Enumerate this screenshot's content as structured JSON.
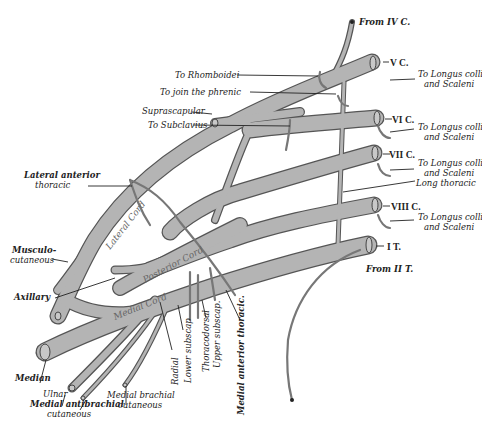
{
  "figure": {
    "roots": [
      {
        "label": "V C.",
        "branch": "To Longus colli and Scaleni"
      },
      {
        "label": "VI C.",
        "branch": "To Longus colli and Scaleni"
      },
      {
        "label": "VII C.",
        "branch": "To Longus colli and Scaleni"
      },
      {
        "label": "VIII C.",
        "branch": "To Longus colli and Scaleni"
      },
      {
        "label": "I T."
      }
    ],
    "top_labels": {
      "from_iv": "From IV C.",
      "from_ii": "From II T.",
      "rhomboidei": "To Rhomboidei",
      "phrenic": "To join the phrenic",
      "suprascapular": "Suprascapular",
      "subclavius": "To Subclavius",
      "longus_line1": "To Longus colli",
      "longus_line2": "and Scaleni",
      "long_thoracic": "Long thoracic"
    },
    "left_labels": {
      "lat_ant_thoracic_1": "Lateral anterior",
      "lat_ant_thoracic_2": "thoracic",
      "musculo_1": "Musculo-",
      "musculo_2": "cutaneous",
      "axillary": "Axillary",
      "median": "Median",
      "ulnar": "Ulnar",
      "med_antibrachial_1": "Medial antibrachial",
      "med_antibrachial_2": "cutaneous",
      "med_brachial_1": "Medial brachial",
      "med_brachial_2": "cutaneous"
    },
    "vertical_labels": {
      "radial": "Radial",
      "lower_subscap": "Lower subscap",
      "thoracodorsal": "Thoracodorsal",
      "upper_subscap": "Upper subscap.",
      "medial_ant_thoracic": "Medial anterior thoracic."
    },
    "cords": {
      "lateral": "Lateral Cord",
      "posterior": "Posterior Cord",
      "medial": "Medial Cord"
    }
  }
}
